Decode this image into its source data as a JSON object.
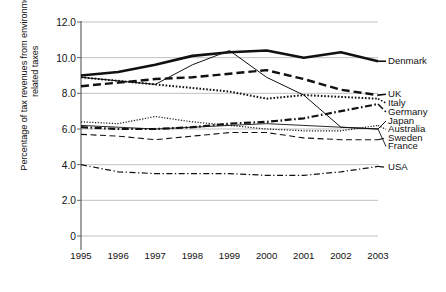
{
  "chart_data": {
    "type": "line",
    "title": "",
    "xlabel": "",
    "ylabel": "Percentage of tax revenues from environmentally-related taxes",
    "x": [
      "1995",
      "1996",
      "1997",
      "1998",
      "1999",
      "2000",
      "2001",
      "2002",
      "2003"
    ],
    "categories": [
      "1995",
      "1996",
      "1997",
      "1998",
      "1999",
      "2000",
      "2001",
      "2002",
      "2003"
    ],
    "ylim": [
      0,
      12
    ],
    "yticks": [
      "0",
      "2.0",
      "4.0",
      "6.0",
      "8.0",
      "10.0",
      "12.0"
    ],
    "ytick_values": [
      0,
      2,
      4,
      6,
      8,
      10,
      12
    ],
    "grid": true,
    "legend_position": "right",
    "series": [
      {
        "name": "Denmark",
        "values": [
          9.0,
          9.2,
          9.6,
          10.1,
          10.3,
          10.4,
          10.0,
          10.3,
          9.8
        ],
        "style": "solid",
        "width": 2.6,
        "dash": "none"
      },
      {
        "name": "UK",
        "values": [
          8.4,
          8.6,
          8.8,
          8.9,
          9.1,
          9.3,
          8.8,
          8.2,
          7.9
        ],
        "style": "dashed",
        "width": 2.4,
        "dash": "8,4"
      },
      {
        "name": "Italy",
        "values": [
          8.9,
          8.7,
          8.5,
          8.3,
          8.1,
          7.7,
          7.9,
          7.8,
          7.7
        ],
        "style": "dotted",
        "width": 2.0,
        "dash": "1.6,1.8"
      },
      {
        "name": "Germany",
        "values": [
          6.1,
          6.0,
          6.0,
          6.1,
          6.3,
          6.4,
          6.6,
          7.0,
          7.4
        ],
        "style": "dash-dot",
        "width": 2.2,
        "dash": "7,2.5,1.6,2.5"
      },
      {
        "name": "Japan",
        "values": [
          8.9,
          8.7,
          8.5,
          9.6,
          10.4,
          8.9,
          7.9,
          6.1,
          6.0
        ],
        "style": "solid-thin",
        "width": 1.0,
        "dash": "none"
      },
      {
        "name": "Australia",
        "values": [
          6.4,
          6.3,
          6.7,
          6.4,
          6.2,
          6.0,
          5.9,
          5.9,
          6.2
        ],
        "style": "fine-dotted",
        "width": 1.2,
        "dash": "1.2,1.6"
      },
      {
        "name": "Sweden",
        "values": [
          5.7,
          5.6,
          5.4,
          5.6,
          5.8,
          5.8,
          5.5,
          5.4,
          5.4
        ],
        "style": "thin-dashed",
        "width": 1.1,
        "dash": "6,3.5"
      },
      {
        "name": "France",
        "values": [
          6.2,
          6.1,
          6.0,
          6.1,
          6.2,
          6.3,
          6.2,
          6.1,
          6.0
        ],
        "style": "solid-thin",
        "width": 0.9,
        "dash": "none"
      },
      {
        "name": "USA",
        "values": [
          4.0,
          3.6,
          3.5,
          3.5,
          3.5,
          3.4,
          3.4,
          3.6,
          3.9
        ],
        "style": "dash-dot-thin",
        "width": 1.2,
        "dash": "6,2.5,1.3,2.5"
      }
    ],
    "legend_entries": [
      {
        "label": "Denmark",
        "y_value": 9.8
      },
      {
        "label": "UK",
        "y_value": 7.95
      },
      {
        "label": "Italy",
        "y_value": 7.45
      },
      {
        "label": "Germany",
        "y_value": 6.95
      },
      {
        "label": "Japan",
        "y_value": 6.45
      },
      {
        "label": "Australia",
        "y_value": 5.98
      },
      {
        "label": "Sweden",
        "y_value": 5.5
      },
      {
        "label": "France",
        "y_value": 5.02
      },
      {
        "label": "USA",
        "y_value": 3.85
      }
    ],
    "colors": {
      "line": "#111111",
      "grid": "#b9b9b9",
      "axis": "#555555",
      "background": "#ffffff",
      "text": "#111111"
    }
  }
}
